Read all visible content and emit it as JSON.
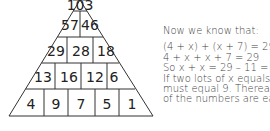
{
  "pyramid": {
    "rows": [
      [
        "103"
      ],
      [
        "57",
        "46"
      ],
      [
        "29",
        "28",
        "18"
      ],
      [
        "13",
        "16",
        "12",
        "6"
      ],
      [
        "4",
        "9",
        "7",
        "5",
        "1"
      ]
    ]
  },
  "text": {
    "intro": "Now we know that:",
    "lines": [
      "(4 + x) + (x + 7) = 29",
      "4 + x + x + 7 = 29",
      "So x + x = 29 – 11 = ",
      "If two lots of x equals 1",
      "must equal 9. Thereafter",
      "of the numbers are easy"
    ]
  },
  "colors": {
    "line": "#333333",
    "text": "#444444",
    "background": "#ffffff"
  }
}
